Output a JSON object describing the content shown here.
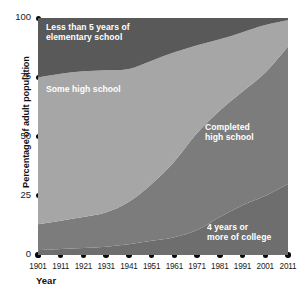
{
  "chart_data": {
    "type": "area",
    "stacked": true,
    "title": "",
    "subtitle": "",
    "xlabel": "Year",
    "ylabel": "Percentage of adult population",
    "xlim": [
      1901,
      2011
    ],
    "ylim": [
      0,
      100
    ],
    "grid": false,
    "legend_position": "inline-annotations",
    "x_tick_labels": [
      "1901",
      "1911",
      "1921",
      "1931",
      "1941",
      "1951",
      "1961",
      "1971",
      "1981",
      "1991",
      "2001",
      "2011"
    ],
    "y_tick_labels": [
      "0",
      "25",
      "50",
      "75",
      "100"
    ],
    "x": [
      1901,
      1911,
      1921,
      1931,
      1941,
      1951,
      1961,
      1971,
      1981,
      1991,
      2001,
      2011
    ],
    "series": [
      {
        "name": "4 years or more of college",
        "color": "#6e6e6e",
        "values": [
          2,
          2.5,
          3,
          3.5,
          4.5,
          6,
          7.5,
          10.5,
          16,
          21,
          25,
          30
        ]
      },
      {
        "name": "Completed high school",
        "color": "#7c7c7c",
        "values": [
          11,
          12,
          13,
          14.5,
          18,
          24,
          32,
          41,
          45,
          48,
          52,
          58
        ]
      },
      {
        "name": "Some high school",
        "color": "#a6a6a6",
        "values": [
          62,
          62,
          61.5,
          60,
          56,
          52,
          46,
          37,
          30,
          25,
          20,
          11
        ]
      },
      {
        "name": "Less than 5 years of elementary school",
        "color": "#595959",
        "values": [
          25,
          23.5,
          22.5,
          22,
          21.5,
          18,
          14.5,
          11.5,
          9,
          6,
          3,
          1
        ]
      }
    ],
    "cumulative_boundaries": {
      "college_top": [
        2,
        2.5,
        3,
        3.5,
        4.5,
        6,
        7.5,
        10.5,
        16,
        21,
        25,
        30
      ],
      "completed_hs_top": [
        13,
        14.5,
        16,
        18,
        22.5,
        30,
        39.5,
        51.5,
        61,
        69,
        77,
        88
      ],
      "some_hs_top": [
        75,
        76.5,
        77.5,
        78,
        78.5,
        82,
        85.5,
        88.5,
        91,
        94,
        97,
        99
      ]
    },
    "annotations": [
      {
        "name": "less-than-5-years",
        "text": "Less than 5 years of\nelementary school",
        "x_px": 46,
        "y_px": 22
      },
      {
        "name": "some-high-school",
        "text": "Some high school",
        "x_px": 46,
        "y_px": 84
      },
      {
        "name": "completed-high-school",
        "text": "Completed\nhigh school",
        "x_px": 205,
        "y_px": 122
      },
      {
        "name": "four-years-college",
        "text": "4 years or\nmore of college",
        "x_px": 207,
        "y_px": 222
      }
    ],
    "colors": {
      "band_top": "#595959",
      "band_some_hs": "#a6a6a6",
      "band_completed_hs": "#7c7c7c",
      "band_college": "#6e6e6e",
      "tick": "#0a0a0a",
      "text": "#1a1a1a",
      "label_text": "#ffffff",
      "background": "#ffffff"
    }
  }
}
